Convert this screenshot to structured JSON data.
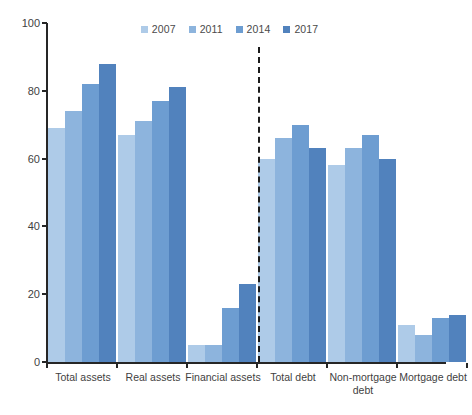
{
  "chart_data": {
    "type": "bar",
    "title": "",
    "xlabel": "",
    "ylabel": "",
    "ylim": [
      0,
      100
    ],
    "yticks": [
      0,
      20,
      40,
      60,
      80,
      100
    ],
    "grid": false,
    "legend_position": "top-center",
    "categories": [
      "Total assets",
      "Real assets",
      "Financial assets",
      "Total debt",
      "Non-mortgage debt",
      "Mortgage debt"
    ],
    "series": [
      {
        "name": "2007",
        "color": "#aecbe8",
        "values": [
          69,
          67,
          5,
          60,
          58,
          11
        ]
      },
      {
        "name": "2011",
        "color": "#8db4dd",
        "values": [
          74,
          71,
          5,
          66,
          63,
          8
        ]
      },
      {
        "name": "2014",
        "color": "#6d9dd1",
        "values": [
          82,
          77,
          16,
          70,
          67,
          13
        ]
      },
      {
        "name": "2017",
        "color": "#5182bd",
        "values": [
          88,
          81,
          23,
          63,
          60,
          14
        ]
      }
    ],
    "annotations": [
      {
        "type": "divider",
        "style": "dashed",
        "after_category": "Financial assets"
      }
    ],
    "axis_color": "#262626"
  }
}
